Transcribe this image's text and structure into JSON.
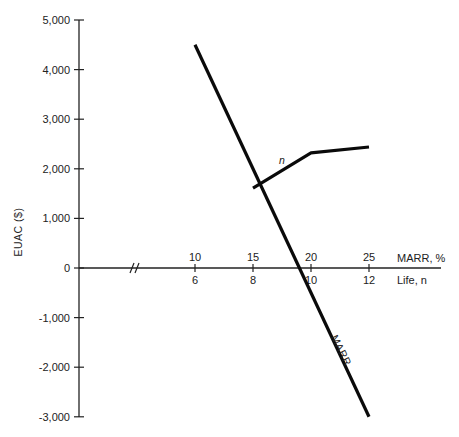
{
  "chart_data": {
    "type": "line",
    "title": "",
    "ylabel": "EUAC ($)",
    "xlabel_primary": "MARR, %",
    "xlabel_secondary": "Life, n",
    "ylim": [
      -3000,
      5000
    ],
    "y_ticks": [
      "5,000",
      "4,000",
      "3,000",
      "2,000",
      "1,000",
      "0",
      "-1,000",
      "-2,000",
      "-3,000"
    ],
    "x_ticks_primary": [
      "10",
      "15",
      "20",
      "25"
    ],
    "x_ticks_secondary": [
      "6",
      "8",
      "10",
      "12"
    ],
    "axis_break": true,
    "grid": false,
    "legend": "none (lines labeled directly)",
    "series": [
      {
        "name": "MARR",
        "label": "MARR",
        "x_axis": "MARR, %",
        "x": [
          10,
          25
        ],
        "values": [
          4500,
          -3000
        ]
      },
      {
        "name": "n",
        "label": "n",
        "x_axis": "Life, n",
        "x": [
          8,
          10,
          12
        ],
        "values": [
          1610,
          2320,
          2440
        ]
      }
    ]
  },
  "labels": {
    "y_axis_title": "EUAC ($)",
    "x_primary_title": "MARR, %",
    "x_secondary_title": "Life, n",
    "series_marr": "MARR",
    "series_n": "n",
    "break_mark": "//"
  }
}
